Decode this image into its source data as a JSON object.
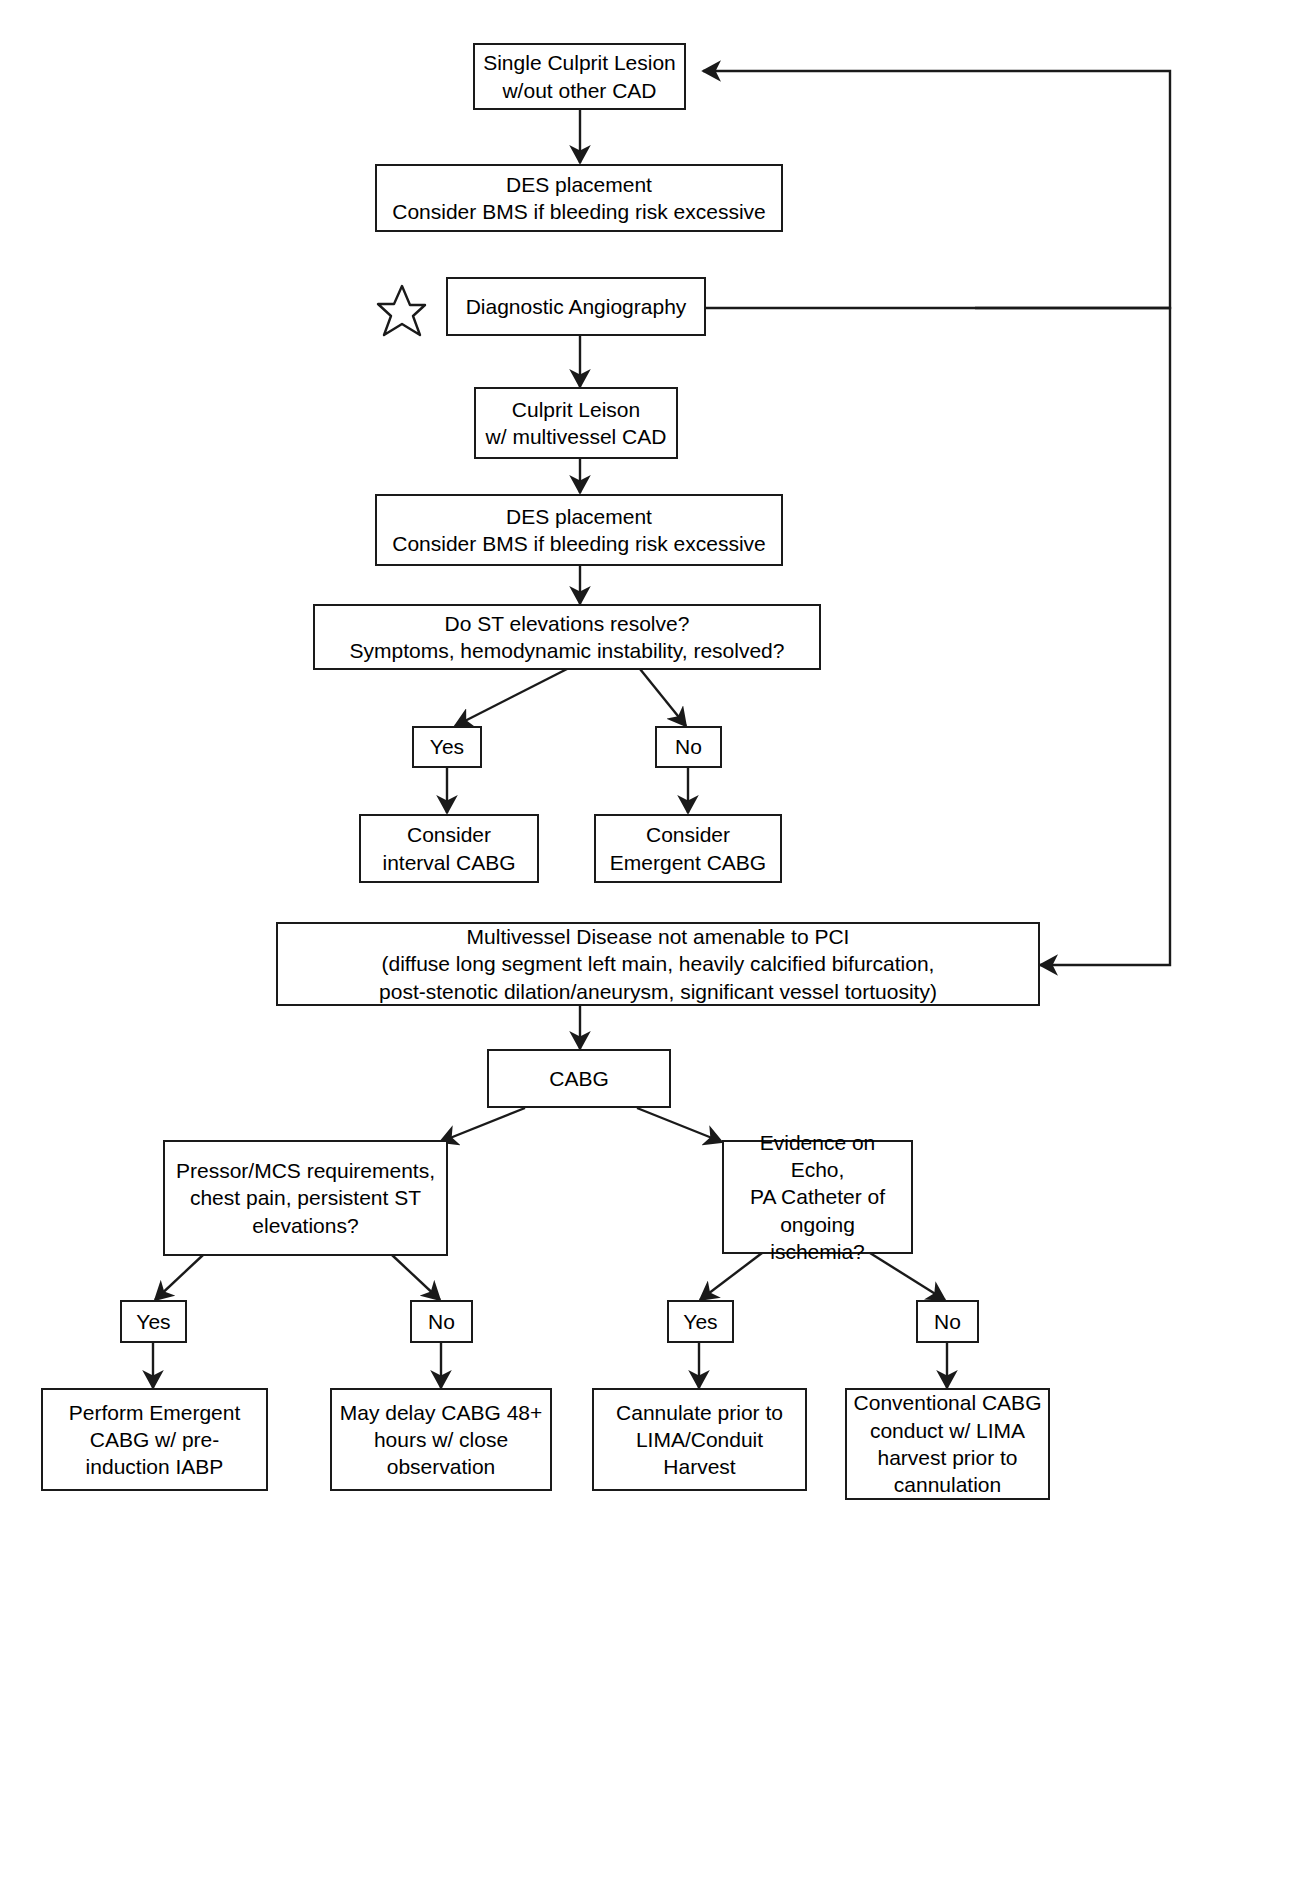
{
  "diagram": {
    "type": "flowchart",
    "background_color": "#ffffff",
    "line_color": "#1a1a1a",
    "text_color": "#000000",
    "nodes": [
      {
        "id": "single_culprit",
        "label": "Single Culprit Lesion\nw/out other CAD"
      },
      {
        "id": "des1",
        "label": "DES placement\nConsider BMS if bleeding risk excessive"
      },
      {
        "id": "diagnostic_angio",
        "label": "Diagnostic Angiography"
      },
      {
        "id": "culprit_multivessel",
        "label": "Culprit Leison\nw/ multivessel CAD"
      },
      {
        "id": "des2",
        "label": "DES placement\nConsider BMS if bleeding risk excessive"
      },
      {
        "id": "st_resolve",
        "label": "Do ST elevations resolve?\nSymptoms, hemodynamic instability, resolved?"
      },
      {
        "id": "st_yes",
        "label": "Yes"
      },
      {
        "id": "st_no",
        "label": "No"
      },
      {
        "id": "interval_cabg",
        "label": "Consider\ninterval CABG"
      },
      {
        "id": "emergent_cabg",
        "label": "Consider\nEmergent CABG"
      },
      {
        "id": "multivessel_not_pci",
        "label": "Multivessel Disease not amenable to PCI\n(diffuse long segment left main, heavily calcified bifurcation,\npost-stenotic dilation/aneurysm, significant vessel tortuosity)"
      },
      {
        "id": "cabg",
        "label": "CABG"
      },
      {
        "id": "pressor_mcs",
        "label": "Pressor/MCS requirements,\nchest pain, persistent ST\nelevations?"
      },
      {
        "id": "echo_evidence",
        "label": "Evidence on Echo,\nPA Catheter of\nongoing\nischemia?"
      },
      {
        "id": "left_yes",
        "label": "Yes"
      },
      {
        "id": "left_no",
        "label": "No"
      },
      {
        "id": "right_yes",
        "label": "Yes"
      },
      {
        "id": "right_no",
        "label": "No"
      },
      {
        "id": "perform_emergent",
        "label": "Perform Emergent\nCABG w/ pre-\ninduction IABP"
      },
      {
        "id": "may_delay",
        "label": "May delay CABG 48+\nhours w/ close\nobservation"
      },
      {
        "id": "cannulate_prior",
        "label": "Cannulate prior to\nLIMA/Conduit\nHarvest"
      },
      {
        "id": "conventional_cabg",
        "label": "Conventional CABG\nconduct w/ LIMA\nharvest prior to\ncannulation"
      }
    ],
    "markers": [
      {
        "id": "star_marker",
        "shape": "five-pointed-star-outline",
        "near": "diagnostic_angio"
      }
    ],
    "edges": [
      {
        "from": "single_culprit",
        "to": "des1"
      },
      {
        "from": "diagnostic_angio",
        "to": "single_culprit",
        "routing": "right-loop-up"
      },
      {
        "from": "diagnostic_angio",
        "to": "culprit_multivessel"
      },
      {
        "from": "diagnostic_angio",
        "to": "multivessel_not_pci",
        "routing": "right-loop-down"
      },
      {
        "from": "culprit_multivessel",
        "to": "des2"
      },
      {
        "from": "des2",
        "to": "st_resolve"
      },
      {
        "from": "st_resolve",
        "to": "st_yes"
      },
      {
        "from": "st_resolve",
        "to": "st_no"
      },
      {
        "from": "st_yes",
        "to": "interval_cabg"
      },
      {
        "from": "st_no",
        "to": "emergent_cabg"
      },
      {
        "from": "multivessel_not_pci",
        "to": "cabg"
      },
      {
        "from": "cabg",
        "to": "pressor_mcs"
      },
      {
        "from": "cabg",
        "to": "echo_evidence"
      },
      {
        "from": "pressor_mcs",
        "to": "left_yes"
      },
      {
        "from": "pressor_mcs",
        "to": "left_no"
      },
      {
        "from": "echo_evidence",
        "to": "right_yes"
      },
      {
        "from": "echo_evidence",
        "to": "right_no"
      },
      {
        "from": "left_yes",
        "to": "perform_emergent"
      },
      {
        "from": "left_no",
        "to": "may_delay"
      },
      {
        "from": "right_yes",
        "to": "cannulate_prior"
      },
      {
        "from": "right_no",
        "to": "conventional_cabg"
      }
    ]
  }
}
